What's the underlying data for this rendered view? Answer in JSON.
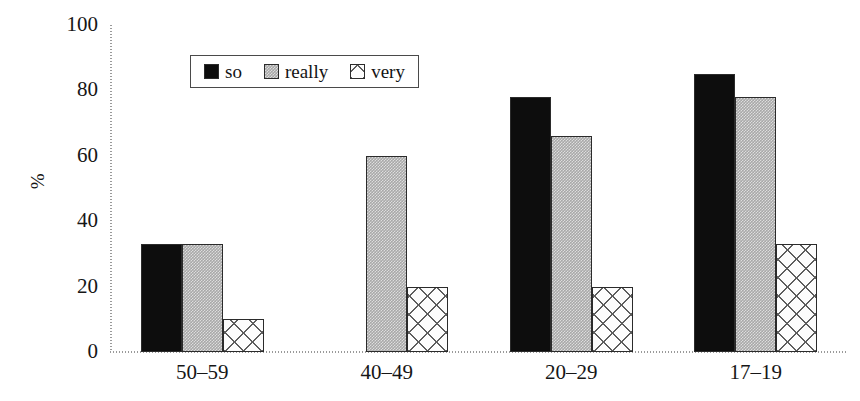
{
  "chart_data": {
    "type": "bar",
    "title": "",
    "xlabel": "",
    "ylabel": "%",
    "ylim": [
      0,
      100
    ],
    "yticks": [
      0,
      20,
      40,
      60,
      80,
      100
    ],
    "grid": false,
    "legend_position": "upper-center-left",
    "categories": [
      "50–59",
      "40–49",
      "20–29",
      "17–19"
    ],
    "series": [
      {
        "name": "so",
        "style": "solid-black",
        "color": "#0d0d0d",
        "values": [
          33,
          0,
          78,
          85
        ]
      },
      {
        "name": "really",
        "style": "gray-stipple",
        "color": "#a8a8a8",
        "values": [
          33,
          60,
          66,
          78
        ]
      },
      {
        "name": "very",
        "style": "cross-hatch",
        "color": "#fcfcfc",
        "values": [
          10,
          20,
          20,
          33
        ]
      }
    ]
  },
  "axes": {
    "y_title": "%",
    "y_tick_labels": [
      "100",
      "80",
      "60",
      "40",
      "20",
      "0"
    ],
    "x_tick_labels": [
      "50–59",
      "40–49",
      "20–29",
      "17–19"
    ]
  },
  "legend": {
    "items": [
      {
        "label": "so",
        "swatch": "solid-black-swatch"
      },
      {
        "label": "really",
        "swatch": "gray-stipple-swatch"
      },
      {
        "label": "very",
        "swatch": "cross-hatch-swatch"
      }
    ]
  }
}
